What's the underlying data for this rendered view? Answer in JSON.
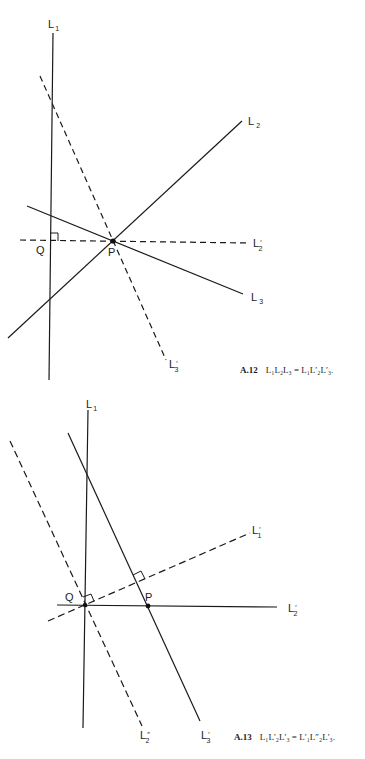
{
  "figures": [
    {
      "id": "A.12",
      "caption": {
        "number": "A.12",
        "equation": "L₁L₂L₃ = L₁L′₂L′₃."
      },
      "points": [
        {
          "name": "P",
          "x": 113,
          "y": 241
        },
        {
          "name": "Q",
          "x": 50,
          "y": 241
        }
      ],
      "lines": [
        {
          "name": "L1",
          "label": "L",
          "sub": "1",
          "prime": "",
          "style": "solid"
        },
        {
          "name": "L2",
          "label": "L",
          "sub": "2",
          "prime": "",
          "style": "solid"
        },
        {
          "name": "L3",
          "label": "L",
          "sub": "3",
          "prime": "",
          "style": "solid"
        },
        {
          "name": "L2'",
          "label": "L",
          "sub": "2",
          "prime": "′",
          "style": "dashed"
        },
        {
          "name": "L3'",
          "label": "L",
          "sub": "3",
          "prime": "′",
          "style": "dashed"
        }
      ]
    },
    {
      "id": "A.13",
      "caption": {
        "number": "A.13",
        "equation": "L₁L′₂L′₃ = L′₁L″₂L′₃."
      },
      "points": [
        {
          "name": "P",
          "x": 148,
          "y": 606
        },
        {
          "name": "Q",
          "x": 85,
          "y": 605
        }
      ],
      "lines": [
        {
          "name": "L1",
          "label": "L",
          "sub": "1",
          "prime": "",
          "style": "solid"
        },
        {
          "name": "L1'",
          "label": "L",
          "sub": "1",
          "prime": "′",
          "style": "dashed"
        },
        {
          "name": "L2'",
          "label": "L",
          "sub": "2",
          "prime": "′",
          "style": "solid"
        },
        {
          "name": "L2''",
          "label": "L",
          "sub": "2",
          "prime": "″",
          "style": "dashed"
        },
        {
          "name": "L3'",
          "label": "L",
          "sub": "3",
          "prime": "′",
          "style": "solid"
        }
      ]
    }
  ],
  "labels": {
    "L": "L",
    "P": "P",
    "Q": "Q",
    "s1": "1",
    "s2": "2",
    "s3": "3",
    "prime": "′",
    "dprime": "″"
  }
}
